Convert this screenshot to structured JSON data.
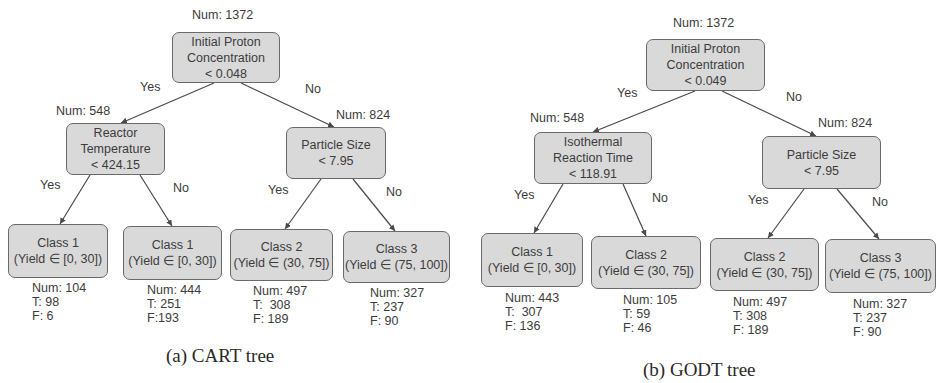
{
  "figures": [
    {
      "caption": "(a) CART tree",
      "root": {
        "num": "Num: 1372",
        "lines": [
          "Initial Proton",
          "Concentration",
          "< 0.048"
        ]
      },
      "left": {
        "num": "Num: 548",
        "lines": [
          "Reactor",
          "Temperature",
          "< 424.15"
        ]
      },
      "right": {
        "num": "Num: 824",
        "lines": [
          "Particle Size",
          "< 7.95"
        ]
      },
      "edge_labels": {
        "root_yes": "Yes",
        "root_no": "No",
        "left_yes": "Yes",
        "left_no": "No",
        "right_yes": "Yes",
        "right_no": "No"
      },
      "leaves": [
        {
          "class": "Class 1",
          "range": "(Yield ∈ [0, 30])",
          "num": "Num: 104",
          "t": "T: 98",
          "f": "F: 6"
        },
        {
          "class": "Class 1",
          "range": "(Yield ∈ [0, 30])",
          "num": "Num: 444",
          "t": "T: 251",
          "f": "F:193"
        },
        {
          "class": "Class 2",
          "range": "(Yield ∈ (30, 75])",
          "num": "Num: 497",
          "t": "T:  308",
          "f": "F: 189"
        },
        {
          "class": "Class 3",
          "range": "(Yield ∈ (75, 100])",
          "num": "Num: 327",
          "t": "T: 237",
          "f": "F: 90"
        }
      ]
    },
    {
      "caption": "(b) GODT tree",
      "root": {
        "num": "Num: 1372",
        "lines": [
          "Initial Proton",
          "Concentration",
          "< 0.049"
        ]
      },
      "left": {
        "num": "Num: 548",
        "lines": [
          "Isothermal",
          "Reaction Time",
          "< 118.91"
        ]
      },
      "right": {
        "num": "Num: 824",
        "lines": [
          "Particle Size",
          "< 7.95"
        ]
      },
      "edge_labels": {
        "root_yes": "Yes",
        "root_no": "No",
        "left_yes": "Yes",
        "left_no": "No",
        "right_yes": "Yes",
        "right_no": "No"
      },
      "leaves": [
        {
          "class": "Class 1",
          "range": "(Yield ∈ [0, 30])",
          "num": "Num: 443",
          "t": "T:  307",
          "f": "F: 136"
        },
        {
          "class": "Class 2",
          "range": "(Yield ∈ (30, 75])",
          "num": "Num: 105",
          "t": "T: 59",
          "f": "F: 46"
        },
        {
          "class": "Class 2",
          "range": "(Yield ∈ (30, 75])",
          "num": "Num: 497",
          "t": "T: 308",
          "f": "F: 189"
        },
        {
          "class": "Class 3",
          "range": "(Yield ∈ (75, 100])",
          "num": "Num: 327",
          "t": "T: 237",
          "f": "F: 90"
        }
      ]
    }
  ],
  "colors": {
    "node_fill": "#d9d9d9",
    "node_border": "#6a6a6a",
    "edge": "#4a4a4a",
    "text": "#3c3c3c"
  }
}
